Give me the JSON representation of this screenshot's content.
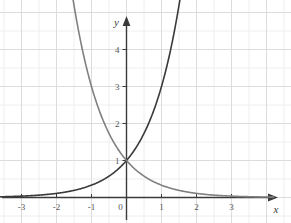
{
  "chart_data": {
    "type": "line",
    "title": "",
    "xlabel": "x",
    "ylabel": "y",
    "xlim": [
      -3.6,
      3.9
    ],
    "ylim": [
      -0.55,
      4.75
    ],
    "grid": true,
    "grid_minor": true,
    "legend": "none",
    "xticks": [
      -3,
      -2,
      -1,
      0,
      1,
      2,
      3
    ],
    "xtick_labels": [
      "-3",
      "-2",
      "-1",
      "0",
      "1",
      "2",
      "3"
    ],
    "yticks": [
      1,
      2,
      3,
      4
    ],
    "ytick_labels": [
      "1",
      "2",
      "3",
      "4"
    ],
    "intersection": {
      "x": 0,
      "y": 1,
      "label": "1"
    },
    "series": [
      {
        "name": "exponential-growth",
        "expression": "y = 3^x",
        "color": "#3a3a3a",
        "width": 1.6,
        "x": [
          -3.6,
          -3.2,
          -2.8,
          -2.4,
          -2.0,
          -1.6,
          -1.2,
          -0.8,
          -0.4,
          0.0,
          0.3,
          0.6,
          0.9,
          1.2,
          1.5,
          1.8,
          2.1,
          2.4
        ],
        "y": [
          0.021,
          0.031,
          0.046,
          0.068,
          0.111,
          0.172,
          0.268,
          0.416,
          0.644,
          1.0,
          1.39,
          1.93,
          2.69,
          3.74,
          5.2,
          7.22,
          10.04,
          13.97
        ]
      },
      {
        "name": "exponential-decay",
        "expression": "y = 3^(-x)",
        "color": "#808080",
        "width": 1.6,
        "x": [
          -3.6,
          -3.2,
          -2.8,
          -2.4,
          -2.0,
          -1.6,
          -1.2,
          -0.8,
          -0.4,
          0.0,
          0.4,
          0.8,
          1.2,
          1.6,
          2.0,
          2.4,
          2.8,
          3.2,
          3.6,
          3.9
        ],
        "y": [
          47.3,
          33.6,
          21.7,
          14.7,
          9.0,
          5.8,
          3.73,
          2.41,
          1.55,
          1.0,
          0.644,
          0.416,
          0.268,
          0.172,
          0.111,
          0.068,
          0.046,
          0.031,
          0.021,
          0.016
        ]
      }
    ]
  },
  "axes": {
    "x_axis_name": "x-axis",
    "y_axis_name": "y-axis",
    "x_arrow": "arrow-right",
    "y_arrow": "arrow-up"
  },
  "colors": {
    "grid_major": "#dcdcdc",
    "grid_minor": "#eeeeee",
    "axis": "#3a3a3a",
    "tick_text": "#555555",
    "background": "#ffffff",
    "curve_growth": "#3a3a3a",
    "curve_decay": "#808080"
  }
}
